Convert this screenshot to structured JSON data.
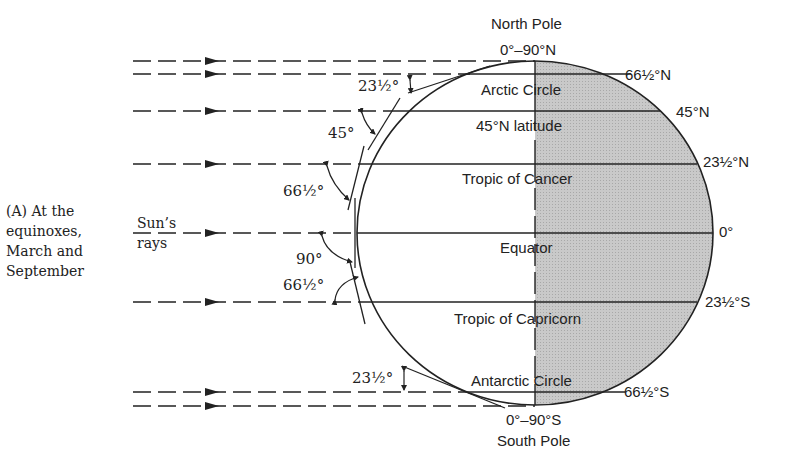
{
  "caption": {
    "line1": "(A)  At the",
    "line2": "equinoxes,",
    "line3": "March and",
    "line4": "September"
  },
  "sun_label": {
    "line1": "Sun’s",
    "line2": "rays"
  },
  "poles": {
    "north_name": "North Pole",
    "north_coord": "0°–90°N",
    "south_coord": "0°–90°S",
    "south_name": "South Pole"
  },
  "parallels": [
    {
      "name": "Arctic Circle",
      "latitude": "66½°N"
    },
    {
      "name": "45°N latitude",
      "latitude": "45°N"
    },
    {
      "name": "Tropic of Cancer",
      "latitude": "23½°N"
    },
    {
      "name": "Equator",
      "latitude": "0°"
    },
    {
      "name": "Tropic of Capricorn",
      "latitude": "23½°S"
    },
    {
      "name": "Antarctic Circle",
      "latitude": "66½°S"
    }
  ],
  "sun_angles": [
    {
      "label": "23½°",
      "at": "Arctic Circle"
    },
    {
      "label": "45°",
      "at": "45°N"
    },
    {
      "label": "66½°",
      "at": "23½°N"
    },
    {
      "label": "90°",
      "at": "Equator"
    },
    {
      "label": "66½°",
      "at": "23½°S"
    },
    {
      "label": "23½°",
      "at": "66½°S"
    }
  ],
  "colors": {
    "night_side": "#c4c4c4",
    "line": "#222222",
    "background": "#ffffff"
  }
}
